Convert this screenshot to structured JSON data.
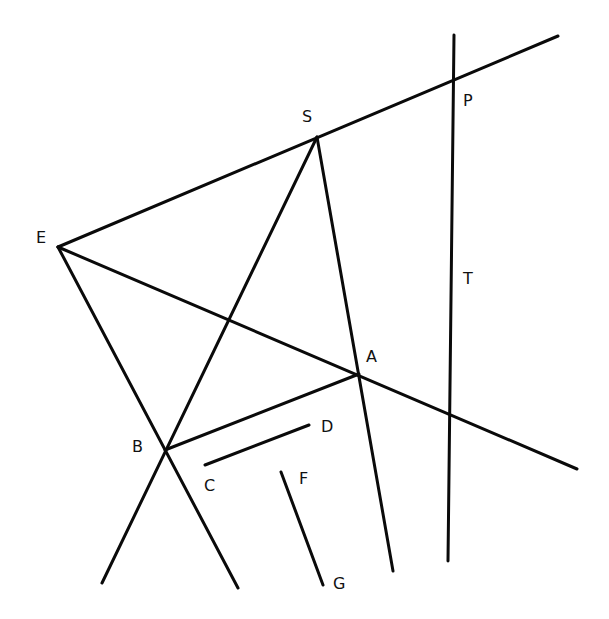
{
  "diagram": {
    "type": "geometric-construction",
    "background": "#ffffff",
    "stroke_color": "#0a0a0a",
    "points": {
      "E": {
        "label": "E",
        "x": 58,
        "y": 247,
        "label_x": 36,
        "label_y": 243
      },
      "S": {
        "label": "S",
        "x": 317,
        "y": 137,
        "label_x": 302,
        "label_y": 122
      },
      "P": {
        "label": "P",
        "x": 453,
        "y": 80,
        "label_x": 463,
        "label_y": 106
      },
      "T": {
        "label": "T",
        "x": 451,
        "y": 275,
        "label_x": 463,
        "label_y": 284
      },
      "A": {
        "label": "A",
        "x": 359,
        "y": 374,
        "label_x": 366,
        "label_y": 362
      },
      "B": {
        "label": "B",
        "x": 165,
        "y": 450,
        "label_x": 132,
        "label_y": 452
      },
      "C": {
        "label": "C",
        "x": 205,
        "y": 465,
        "label_x": 204,
        "label_y": 491
      },
      "D": {
        "label": "D",
        "x": 309,
        "y": 425,
        "label_x": 321,
        "label_y": 432
      },
      "F": {
        "label": "F",
        "x": 281,
        "y": 472,
        "label_x": 299,
        "label_y": 484
      },
      "G": {
        "label": "G",
        "x": 323,
        "y": 585,
        "label_x": 333,
        "label_y": 589
      }
    },
    "lines": [
      {
        "name": "line-esp",
        "desc": "Line through E, S, P",
        "x1": 58,
        "y1": 247,
        "x2": 558,
        "y2": 36
      },
      {
        "name": "line-pt",
        "desc": "Near-vertical line through P and T",
        "x1": 454,
        "y1": 35,
        "x2": 448,
        "y2": 561
      },
      {
        "name": "line-ea",
        "desc": "Line from E through A",
        "x1": 58,
        "y1": 247,
        "x2": 577,
        "y2": 469
      },
      {
        "name": "line-eb",
        "desc": "Line from E through B",
        "x1": 58,
        "y1": 247,
        "x2": 238,
        "y2": 588
      },
      {
        "name": "line-sb",
        "desc": "Line from S through B",
        "x1": 317,
        "y1": 137,
        "x2": 102,
        "y2": 583
      },
      {
        "name": "line-sa",
        "desc": "Line from S through A",
        "x1": 317,
        "y1": 137,
        "x2": 393,
        "y2": 571
      },
      {
        "name": "segment-ba",
        "desc": "Segment B to A",
        "x1": 165,
        "y1": 450,
        "x2": 359,
        "y2": 374
      },
      {
        "name": "segment-cd",
        "desc": "Segment C to D",
        "x1": 205,
        "y1": 465,
        "x2": 309,
        "y2": 425
      },
      {
        "name": "segment-fg",
        "desc": "Segment F to G",
        "x1": 281,
        "y1": 472,
        "x2": 323,
        "y2": 585
      }
    ]
  }
}
